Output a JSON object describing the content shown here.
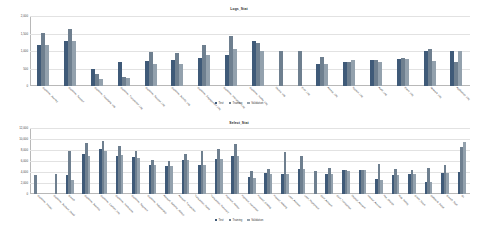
{
  "figure": {
    "background": "#ffffff",
    "series_colors": [
      "#3f5a78",
      "#6e7f8f",
      "#93a1ad"
    ]
  },
  "legend": {
    "items": [
      {
        "label": "Test",
        "color": "#3f5a78"
      },
      {
        "label": "Training",
        "color": "#6e7f8f"
      },
      {
        "label": "Validation",
        "color": "#93a1ad"
      }
    ]
  },
  "chart_data": [
    {
      "id": "logs_stat",
      "type": "bar",
      "title": "Logs_Stat",
      "xlabel": "",
      "ylabel": "",
      "ylim": [
        0,
        2000
      ],
      "grid": true,
      "legend_position": "bottom",
      "yticks": [
        0,
        500,
        1000,
        1500,
        2000
      ],
      "ytick_labels": [
        "0",
        "500",
        "1,000",
        "1,500",
        "2,000"
      ],
      "categories": [
        "Customer_Journey",
        "Customer_Support",
        "Customer_Feedback_Log",
        "Customer_Transaction_Log",
        "Customer_Session_Log",
        "Customer_Activity_Log",
        "Customer_Engagement_Log",
        "Customer_Interaction_Log",
        "Customer_Profile_Log",
        "Device_Log",
        "Error_Log",
        "Access_Log",
        "System_Log",
        "Audit_Log",
        "Event_Log",
        "Network_Log",
        "Application_Log"
      ],
      "series": [
        {
          "name": "Test",
          "color": "#3f5a78",
          "values": [
            1180,
            1280,
            480,
            700,
            720,
            730,
            790,
            900,
            1290,
            null,
            null,
            640,
            680,
            740,
            760,
            1000,
            1010
          ]
        },
        {
          "name": "Training",
          "color": "#6e7f8f",
          "values": [
            1520,
            1620,
            350,
            270,
            960,
            940,
            1180,
            1420,
            1220,
            1000,
            1000,
            840,
            700,
            730,
            790,
            1060,
            700
          ]
        },
        {
          "name": "Validation",
          "color": "#93a1ad",
          "values": [
            1180,
            1280,
            200,
            220,
            640,
            620,
            890,
            1060,
            1000,
            null,
            null,
            630,
            730,
            690,
            780,
            710,
            990
          ]
        }
      ]
    },
    {
      "id": "select_stat",
      "type": "bar",
      "title": "Select_Stat",
      "xlabel": "",
      "ylabel": "",
      "ylim": [
        0,
        12000
      ],
      "grid": true,
      "legend_position": "bottom",
      "yticks": [
        0,
        2000,
        4000,
        6000,
        8000,
        10000,
        12000
      ],
      "ytick_labels": [
        "0",
        "2,000",
        "4,000",
        "6,000",
        "8,000",
        "10,000",
        "12,000"
      ],
      "categories": [
        "Customer_Master",
        "Customer_Account_Detail",
        "Branch",
        "Customer_Address",
        "Customer_Contact_Info",
        "Customer_Preference",
        "Customer_Segment",
        "Customer_Relationship",
        "Account_Balance_History",
        "Account_Transaction",
        "Transaction_Detail",
        "Transaction_Summary",
        "Payment_History",
        "Payment_Instruction",
        "Product_Catalog",
        "Product_Holding",
        "Loan_Account",
        "Loan_Repayment",
        "Card_Account",
        "Card_Transaction",
        "Deposit_Account",
        "Interest_Accrual",
        "Fee_Charge",
        "Risk_Rating",
        "Credit_Score",
        "Collateral_Detail",
        "Branch_Staff",
        "GL"
      ],
      "series": [
        {
          "name": "Test",
          "color": "#3f5a78",
          "values": [
            null,
            null,
            null,
            3400,
            7200,
            8100,
            7000,
            6800,
            5200,
            5100,
            6100,
            5200,
            6400,
            7000,
            3100,
            3800,
            3700,
            4600,
            null,
            3700,
            4300,
            4400,
            2700,
            3500,
            3700,
            2200,
            3900,
            4000
          ]
        },
        {
          "name": "Training",
          "color": "#6e7f8f",
          "values": [
            3500,
            null,
            3600,
            7800,
            9200,
            9700,
            8700,
            7800,
            6100,
            6000,
            7200,
            7900,
            8100,
            9100,
            4100,
            4600,
            7600,
            6900,
            4200,
            4700,
            4300,
            4400,
            5400,
            4500,
            4400,
            4700,
            5200,
            8600
          ]
        },
        {
          "name": "Validation",
          "color": "#93a1ad",
          "values": [
            null,
            null,
            null,
            2600,
            7000,
            7800,
            7100,
            6600,
            5200,
            5100,
            6100,
            5200,
            6400,
            7000,
            3000,
            3700,
            3700,
            4500,
            null,
            3600,
            4200,
            4300,
            2600,
            3400,
            3600,
            2100,
            3800,
            9400
          ]
        }
      ]
    }
  ]
}
